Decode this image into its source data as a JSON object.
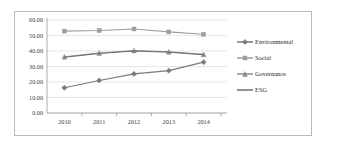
{
  "chart_data": {
    "type": "line",
    "title": "",
    "xlabel": "",
    "ylabel": "",
    "categories": [
      "2010",
      "2011",
      "2012",
      "2013",
      "2014"
    ],
    "x": [
      2010,
      2011,
      2012,
      2013,
      2014
    ],
    "ylim": [
      0.0,
      60.0
    ],
    "y_ticks": [
      "0.00",
      "10.00",
      "20.00",
      "30.00",
      "40.00",
      "50.00",
      "60.00"
    ],
    "y_tick_values": [
      0,
      10,
      20,
      30,
      40,
      50,
      60
    ],
    "y_tick_step": 10,
    "grid": true,
    "legend_position": "right",
    "series": [
      {
        "name": "Environmental",
        "marker": "diamond",
        "color": "#7a7a7a",
        "values": [
          16.3,
          21.0,
          25.2,
          27.3,
          32.8
        ]
      },
      {
        "name": "Social",
        "marker": "square",
        "color": "#9e9e9e",
        "values": [
          52.8,
          53.2,
          54.2,
          52.3,
          50.8
        ]
      },
      {
        "name": "Governance",
        "marker": "triangle",
        "color": "#8e8e8e",
        "values": [
          36.3,
          38.7,
          40.3,
          39.5,
          37.8
        ]
      },
      {
        "name": "ESG",
        "marker": "line",
        "color": "#6f6f6f",
        "values": [
          36.0,
          38.4,
          40.0,
          39.2,
          37.6
        ]
      }
    ]
  },
  "legend": {
    "items": [
      {
        "label": "Environmental",
        "color": "#7a7a7a",
        "marker": "diamond"
      },
      {
        "label": "Social",
        "color": "#9e9e9e",
        "marker": "square"
      },
      {
        "label": "Governance",
        "color": "#8e8e8e",
        "marker": "triangle"
      },
      {
        "label": "ESG",
        "color": "#6f6f6f",
        "marker": "line"
      }
    ]
  },
  "axes": {
    "y_labels": [
      "60.00",
      "50.00",
      "40.00",
      "30.00",
      "20.00",
      "10.00",
      "0.00"
    ],
    "x_labels": [
      "2010",
      "2011",
      "2012",
      "2013",
      "2014"
    ]
  },
  "style": {
    "frame_color": "#b9b9b9",
    "grid_color": "#d6d6d6",
    "axis_color": "#9a9a9a",
    "text_color": "#3a3a3a",
    "background": "#ffffff"
  }
}
